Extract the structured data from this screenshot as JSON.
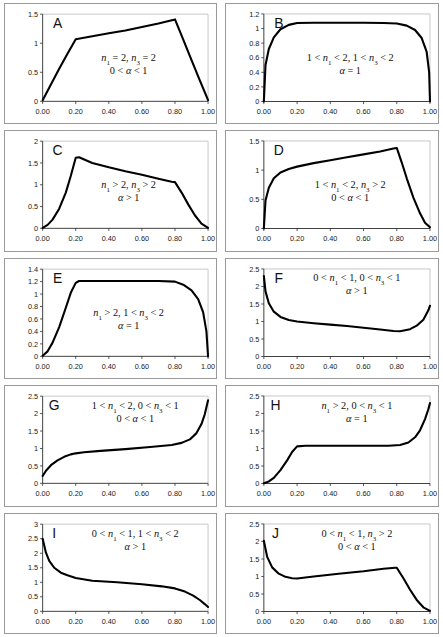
{
  "figure": {
    "title": "",
    "panel_count": 10,
    "layout": "2 columns x 5 rows",
    "curve_color": "#000000",
    "axis_color": "#2b2b2b",
    "frame_color": "#b9b9b9"
  },
  "x_tick_labels": [
    "0.00",
    "0.20",
    "0.40",
    "0.60",
    "0.80",
    "1.00"
  ],
  "x_tick_values": [
    0,
    0.2,
    0.4,
    0.6,
    0.8,
    1.0
  ],
  "chart_data": [
    {
      "id": "A",
      "type": "line",
      "letter": "A",
      "title": "",
      "xlabel": "",
      "ylabel": "",
      "xlim": [
        0,
        1
      ],
      "ylim": [
        0,
        1.5
      ],
      "grid": false,
      "legend": "none",
      "y_tick_labels": [
        "0",
        "0.5",
        "1",
        "1.5"
      ],
      "y_tick_values": [
        0,
        0.5,
        1,
        1.5
      ],
      "annotation_line1": "n1 = 2, n3 = 2",
      "annotation_line2": "0 < α < 1",
      "ann1_parts": [
        {
          "t": "n",
          "i": true
        },
        {
          "t": "1",
          "sub": true
        },
        {
          "t": " = 2, ",
          "i": false
        },
        {
          "t": "n",
          "i": true
        },
        {
          "t": "3",
          "sub": true
        },
        {
          "t": " = 2",
          "i": false
        }
      ],
      "ann2_parts": [
        {
          "t": "0 < ",
          "i": false
        },
        {
          "t": "α",
          "i": true
        },
        {
          "t": " < 1",
          "i": false
        }
      ],
      "x": [
        0,
        0.05,
        0.1,
        0.15,
        0.2,
        0.3,
        0.4,
        0.5,
        0.6,
        0.7,
        0.8,
        0.85,
        0.9,
        0.95,
        1.0
      ],
      "y": [
        0.02,
        0.29,
        0.56,
        0.82,
        1.07,
        1.12,
        1.17,
        1.22,
        1.28,
        1.34,
        1.41,
        1.06,
        0.71,
        0.36,
        0.02
      ]
    },
    {
      "id": "B",
      "type": "line",
      "letter": "B",
      "title": "",
      "xlabel": "",
      "ylabel": "",
      "xlim": [
        0,
        1
      ],
      "ylim": [
        0,
        1.2
      ],
      "grid": false,
      "legend": "none",
      "y_tick_labels": [
        "0",
        "0.2",
        "0.4",
        "0.6",
        "0.8",
        "1",
        "1.2"
      ],
      "y_tick_values": [
        0,
        0.2,
        0.4,
        0.6,
        0.8,
        1.0,
        1.2
      ],
      "annotation_line1": "1 < n1 < 2, 1 < n3 < 2",
      "annotation_line2": "α = 1",
      "ann1_parts": [
        {
          "t": "1 < ",
          "i": false
        },
        {
          "t": "n",
          "i": true
        },
        {
          "t": "1",
          "sub": true
        },
        {
          "t": " < 2, 1 < ",
          "i": false
        },
        {
          "t": "n",
          "i": true
        },
        {
          "t": "3",
          "sub": true
        },
        {
          "t": " < 2",
          "i": false
        }
      ],
      "ann2_parts": [
        {
          "t": "α",
          "i": true
        },
        {
          "t": " = 1",
          "i": false
        }
      ],
      "x": [
        0,
        0.01,
        0.03,
        0.06,
        0.1,
        0.15,
        0.2,
        0.3,
        0.45,
        0.6,
        0.72,
        0.8,
        0.86,
        0.91,
        0.95,
        0.98,
        0.995,
        1.0
      ],
      "y": [
        0.0,
        0.5,
        0.72,
        0.88,
        0.99,
        1.05,
        1.075,
        1.08,
        1.08,
        1.08,
        1.075,
        1.07,
        1.04,
        0.98,
        0.87,
        0.68,
        0.4,
        0.0
      ]
    },
    {
      "id": "C",
      "type": "line",
      "letter": "C",
      "title": "",
      "xlabel": "",
      "ylabel": "",
      "xlim": [
        0,
        1
      ],
      "ylim": [
        0,
        2
      ],
      "grid": false,
      "legend": "none",
      "y_tick_labels": [
        "0",
        "0.5",
        "1",
        "1.5",
        "2"
      ],
      "y_tick_values": [
        0,
        0.5,
        1,
        1.5,
        2
      ],
      "annotation_line1": "n1 > 2, n3 > 2",
      "annotation_line2": "α > 1",
      "ann1_parts": [
        {
          "t": "n",
          "i": true
        },
        {
          "t": "1",
          "sub": true
        },
        {
          "t": " > 2, ",
          "i": false
        },
        {
          "t": "n",
          "i": true
        },
        {
          "t": "3",
          "sub": true
        },
        {
          "t": " > 2",
          "i": false
        }
      ],
      "ann2_parts": [
        {
          "t": "α",
          "i": true
        },
        {
          "t": " > 1",
          "i": false
        }
      ],
      "x": [
        0,
        0.03,
        0.06,
        0.1,
        0.14,
        0.17,
        0.2,
        0.22,
        0.3,
        0.4,
        0.5,
        0.6,
        0.7,
        0.78,
        0.8,
        0.84,
        0.88,
        0.92,
        0.96,
        1.0
      ],
      "y": [
        0.01,
        0.08,
        0.2,
        0.45,
        0.82,
        1.2,
        1.62,
        1.63,
        1.5,
        1.4,
        1.31,
        1.23,
        1.14,
        1.07,
        1.06,
        0.82,
        0.55,
        0.3,
        0.11,
        0.01
      ]
    },
    {
      "id": "D",
      "type": "line",
      "letter": "D",
      "title": "",
      "xlabel": "",
      "ylabel": "",
      "xlim": [
        0,
        1
      ],
      "ylim": [
        0,
        1.5
      ],
      "grid": false,
      "legend": "none",
      "y_tick_labels": [
        "0",
        "0.5",
        "1",
        "1.5"
      ],
      "y_tick_values": [
        0,
        0.5,
        1,
        1.5
      ],
      "annotation_line1": "1 < n1 < 2, n3 > 2",
      "annotation_line2": "0 < α < 1",
      "ann1_parts": [
        {
          "t": "1 < ",
          "i": false
        },
        {
          "t": "n",
          "i": true
        },
        {
          "t": "1",
          "sub": true
        },
        {
          "t": " < 2, ",
          "i": false
        },
        {
          "t": "n",
          "i": true
        },
        {
          "t": "3",
          "sub": true
        },
        {
          "t": " > 2",
          "i": false
        }
      ],
      "ann2_parts": [
        {
          "t": "0 < ",
          "i": false
        },
        {
          "t": "α",
          "i": true
        },
        {
          "t": " < 1",
          "i": false
        }
      ],
      "x": [
        0,
        0.01,
        0.03,
        0.06,
        0.1,
        0.15,
        0.2,
        0.3,
        0.4,
        0.5,
        0.6,
        0.7,
        0.78,
        0.8,
        0.83,
        0.86,
        0.9,
        0.94,
        0.97,
        1.0
      ],
      "y": [
        0.0,
        0.48,
        0.7,
        0.86,
        0.96,
        1.02,
        1.06,
        1.12,
        1.17,
        1.22,
        1.27,
        1.32,
        1.37,
        1.38,
        1.13,
        0.86,
        0.53,
        0.26,
        0.1,
        0.02
      ]
    },
    {
      "id": "E",
      "type": "line",
      "letter": "E",
      "title": "",
      "xlabel": "",
      "ylabel": "",
      "xlim": [
        0,
        1
      ],
      "ylim": [
        0,
        1.4
      ],
      "grid": false,
      "legend": "none",
      "y_tick_labels": [
        "0",
        "0.2",
        "0.4",
        "0.6",
        "0.8",
        "1",
        "1.2",
        "1.4"
      ],
      "y_tick_values": [
        0,
        0.2,
        0.4,
        0.6,
        0.8,
        1.0,
        1.2,
        1.4
      ],
      "annotation_line1": "n1 > 2, 1 < n3 < 2",
      "annotation_line2": "α = 1",
      "ann1_parts": [
        {
          "t": "n",
          "i": true
        },
        {
          "t": "1",
          "sub": true
        },
        {
          "t": " > 2, 1 < ",
          "i": false
        },
        {
          "t": "n",
          "i": true
        },
        {
          "t": "3",
          "sub": true
        },
        {
          "t": " < 2",
          "i": false
        }
      ],
      "ann2_parts": [
        {
          "t": "α",
          "i": true
        },
        {
          "t": " = 1",
          "i": false
        }
      ],
      "x": [
        0,
        0.03,
        0.06,
        0.1,
        0.14,
        0.17,
        0.2,
        0.22,
        0.3,
        0.5,
        0.7,
        0.8,
        0.85,
        0.9,
        0.94,
        0.97,
        0.99,
        1.0
      ],
      "y": [
        0.01,
        0.08,
        0.22,
        0.47,
        0.78,
        1.02,
        1.18,
        1.21,
        1.21,
        1.21,
        1.21,
        1.2,
        1.15,
        1.06,
        0.92,
        0.71,
        0.4,
        0.0
      ]
    },
    {
      "id": "F",
      "type": "line",
      "letter": "F",
      "title": "",
      "xlabel": "",
      "ylabel": "",
      "xlim": [
        0,
        1
      ],
      "ylim": [
        0,
        2.5
      ],
      "grid": false,
      "legend": "none",
      "y_tick_labels": [
        "0",
        "0.5",
        "1",
        "1.5",
        "2",
        "2.5"
      ],
      "y_tick_values": [
        0,
        0.5,
        1,
        1.5,
        2,
        2.5
      ],
      "annotation_line1": "0 < n1 < 1, 0 < n3 < 1",
      "annotation_line2": "α > 1",
      "ann1_parts": [
        {
          "t": "0 < ",
          "i": false
        },
        {
          "t": "n",
          "i": true
        },
        {
          "t": "1",
          "sub": true
        },
        {
          "t": " < 1, 0 < ",
          "i": false
        },
        {
          "t": "n",
          "i": true
        },
        {
          "t": "3",
          "sub": true
        },
        {
          "t": " < 1",
          "i": false
        }
      ],
      "ann2_parts": [
        {
          "t": "α",
          "i": true
        },
        {
          "t": " > 1",
          "i": false
        }
      ],
      "x": [
        0,
        0.01,
        0.03,
        0.06,
        0.1,
        0.15,
        0.2,
        0.3,
        0.4,
        0.5,
        0.6,
        0.7,
        0.78,
        0.82,
        0.88,
        0.92,
        0.96,
        0.99,
        1.0
      ],
      "y": [
        2.3,
        1.86,
        1.52,
        1.28,
        1.13,
        1.04,
        1.0,
        0.95,
        0.91,
        0.87,
        0.82,
        0.77,
        0.73,
        0.72,
        0.78,
        0.88,
        1.05,
        1.32,
        1.45
      ]
    },
    {
      "id": "G",
      "type": "line",
      "letter": "G",
      "title": "",
      "xlabel": "",
      "ylabel": "",
      "xlim": [
        0,
        1
      ],
      "ylim": [
        0,
        2.5
      ],
      "grid": false,
      "legend": "none",
      "y_tick_labels": [
        "0",
        "0.5",
        "1",
        "1.5",
        "2",
        "2.5"
      ],
      "y_tick_values": [
        0,
        0.5,
        1,
        1.5,
        2,
        2.5
      ],
      "annotation_line1": "1 < n1 < 2, 0 < n3 < 1",
      "annotation_line2": "0 < α < 1",
      "ann1_parts": [
        {
          "t": "1 < ",
          "i": false
        },
        {
          "t": "n",
          "i": true
        },
        {
          "t": "1",
          "sub": true
        },
        {
          "t": " < 2, 0 < ",
          "i": false
        },
        {
          "t": "n",
          "i": true
        },
        {
          "t": "3",
          "sub": true
        },
        {
          "t": " < 1",
          "i": false
        }
      ],
      "ann2_parts": [
        {
          "t": "0 < ",
          "i": false
        },
        {
          "t": "α",
          "i": true
        },
        {
          "t": " < 1",
          "i": false
        }
      ],
      "x": [
        0,
        0.02,
        0.05,
        0.09,
        0.13,
        0.17,
        0.2,
        0.25,
        0.35,
        0.5,
        0.65,
        0.78,
        0.84,
        0.89,
        0.93,
        0.96,
        0.98,
        1.0
      ],
      "y": [
        0.21,
        0.36,
        0.52,
        0.66,
        0.76,
        0.83,
        0.86,
        0.89,
        0.93,
        0.98,
        1.04,
        1.1,
        1.16,
        1.26,
        1.44,
        1.7,
        1.98,
        2.38
      ]
    },
    {
      "id": "H",
      "type": "line",
      "letter": "H",
      "title": "",
      "xlabel": "",
      "ylabel": "",
      "xlim": [
        0,
        1
      ],
      "ylim": [
        0,
        2.5
      ],
      "grid": false,
      "legend": "none",
      "y_tick_labels": [
        "0",
        "0.5",
        "1",
        "1.5",
        "2",
        "2.5"
      ],
      "y_tick_values": [
        0,
        0.5,
        1,
        1.5,
        2,
        2.5
      ],
      "annotation_line1": "n1 > 2, 0 < n3 < 1",
      "annotation_line2": "α = 1",
      "ann1_parts": [
        {
          "t": "n",
          "i": true
        },
        {
          "t": "1",
          "sub": true
        },
        {
          "t": " > 2, 0 < ",
          "i": false
        },
        {
          "t": "n",
          "i": true
        },
        {
          "t": "3",
          "sub": true
        },
        {
          "t": " < 1",
          "i": false
        }
      ],
      "ann2_parts": [
        {
          "t": "α",
          "i": true
        },
        {
          "t": " = 1",
          "i": false
        }
      ],
      "x": [
        0,
        0.03,
        0.06,
        0.1,
        0.14,
        0.17,
        0.2,
        0.25,
        0.4,
        0.6,
        0.75,
        0.82,
        0.87,
        0.91,
        0.94,
        0.97,
        0.99,
        1.0
      ],
      "y": [
        0.01,
        0.06,
        0.16,
        0.38,
        0.66,
        0.9,
        1.06,
        1.08,
        1.08,
        1.08,
        1.08,
        1.1,
        1.17,
        1.32,
        1.52,
        1.84,
        2.12,
        2.3
      ]
    },
    {
      "id": "I",
      "type": "line",
      "letter": "I",
      "title": "",
      "xlabel": "",
      "ylabel": "",
      "xlim": [
        0,
        1
      ],
      "ylim": [
        0,
        3
      ],
      "grid": false,
      "legend": "none",
      "y_tick_labels": [
        "0",
        "0.5",
        "1",
        "1.5",
        "2",
        "2.5",
        "3"
      ],
      "y_tick_values": [
        0,
        0.5,
        1,
        1.5,
        2,
        2.5,
        3
      ],
      "annotation_line1": "0 < n1 < 1, 1 < n3 < 2",
      "annotation_line2": "α > 1",
      "ann1_parts": [
        {
          "t": "0 < ",
          "i": false
        },
        {
          "t": "n",
          "i": true
        },
        {
          "t": "1",
          "sub": true
        },
        {
          "t": " < 1, 1 < ",
          "i": false
        },
        {
          "t": "n",
          "i": true
        },
        {
          "t": "3",
          "sub": true
        },
        {
          "t": " < 2",
          "i": false
        }
      ],
      "ann2_parts": [
        {
          "t": "α",
          "i": true
        },
        {
          "t": " > 1",
          "i": false
        }
      ],
      "x": [
        0,
        0.02,
        0.04,
        0.07,
        0.11,
        0.15,
        0.2,
        0.3,
        0.45,
        0.6,
        0.72,
        0.8,
        0.86,
        0.91,
        0.95,
        0.98,
        1.0
      ],
      "y": [
        2.5,
        2.02,
        1.74,
        1.5,
        1.33,
        1.24,
        1.15,
        1.05,
        1.0,
        0.93,
        0.86,
        0.79,
        0.68,
        0.54,
        0.39,
        0.25,
        0.15
      ]
    },
    {
      "id": "J",
      "type": "line",
      "letter": "J",
      "title": "",
      "xlabel": "",
      "ylabel": "",
      "xlim": [
        0,
        1
      ],
      "ylim": [
        0,
        2.5
      ],
      "grid": false,
      "legend": "none",
      "y_tick_labels": [
        "0",
        "0.5",
        "1",
        "1.5",
        "2",
        "2.5"
      ],
      "y_tick_values": [
        0,
        0.5,
        1,
        1.5,
        2,
        2.5
      ],
      "annotation_line1": "0 < n1 < 1, n3 > 2",
      "annotation_line2": "0 < α < 1",
      "ann1_parts": [
        {
          "t": "0 < ",
          "i": false
        },
        {
          "t": "n",
          "i": true
        },
        {
          "t": "1",
          "sub": true
        },
        {
          "t": " < 1, ",
          "i": false
        },
        {
          "t": "n",
          "i": true
        },
        {
          "t": "3",
          "sub": true
        },
        {
          "t": " > 2",
          "i": false
        }
      ],
      "ann2_parts": [
        {
          "t": "0 < ",
          "i": false
        },
        {
          "t": "α",
          "i": true
        },
        {
          "t": " < 1",
          "i": false
        }
      ],
      "x": [
        0,
        0.02,
        0.05,
        0.09,
        0.13,
        0.17,
        0.2,
        0.3,
        0.45,
        0.6,
        0.72,
        0.79,
        0.8,
        0.84,
        0.88,
        0.92,
        0.96,
        1.0
      ],
      "y": [
        2.02,
        1.56,
        1.26,
        1.08,
        0.99,
        0.95,
        0.94,
        1.0,
        1.08,
        1.15,
        1.22,
        1.25,
        1.25,
        0.95,
        0.62,
        0.33,
        0.12,
        0.02
      ]
    }
  ]
}
